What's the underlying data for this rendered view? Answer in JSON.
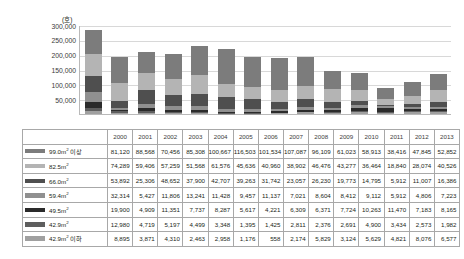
{
  "chart_data": {
    "type": "bar",
    "stacked": true,
    "title": "",
    "subtitle": "",
    "unit_label": "(호)",
    "xlabel": "",
    "ylabel": "",
    "ylim": [
      0,
      300000
    ],
    "ytick_values": [
      300000,
      250000,
      200000,
      150000,
      100000,
      50000
    ],
    "ytick_labels": [
      "300,000",
      "250,000",
      "200,000",
      "150,000",
      "100,000",
      "50,000"
    ],
    "grid": true,
    "legend_position": "table-row-headers",
    "categories": [
      "2000",
      "2001",
      "2002",
      "2003",
      "2004",
      "2005",
      "2006",
      "2007",
      "2008",
      "2009",
      "2010",
      "2011",
      "2012",
      "2013"
    ],
    "series": [
      {
        "name": "99.0m² 이상",
        "name_base": "99.0m",
        "name_sup": "2",
        "name_tail": " 이상",
        "color": "#7c7c7c",
        "values": [
          81120,
          88568,
          70456,
          85308,
          100667,
          116503,
          101534,
          107087,
          96109,
          61023,
          58913,
          38416,
          47845,
          52852
        ],
        "labels": [
          "81,120",
          "88,568",
          "70,456",
          "85,308",
          "100,667",
          "116,503",
          "101,534",
          "107,087",
          "96,109",
          "61,023",
          "58,913",
          "38,416",
          "47,845",
          "52,852"
        ]
      },
      {
        "name": "82.5m²",
        "name_base": "82.5m",
        "name_sup": "2",
        "name_tail": "",
        "color": "#b4b4b4",
        "values": [
          74289,
          59406,
          57259,
          51568,
          61576,
          45636,
          40960,
          38902,
          46476,
          43277,
          36464,
          18840,
          28074,
          40526
        ],
        "labels": [
          "74,289",
          "59,406",
          "57,259",
          "51,568",
          "61,576",
          "45,636",
          "40,960",
          "38,902",
          "46,476",
          "43,277",
          "36,464",
          "18,840",
          "28,074",
          "40,526"
        ]
      },
      {
        "name": "66.0m²",
        "name_base": "66.0m",
        "name_sup": "2",
        "name_tail": "",
        "color": "#4f4f4f",
        "values": [
          53892,
          25306,
          48652,
          37900,
          42707,
          39263,
          31742,
          23057,
          26230,
          19773,
          14795,
          5912,
          11007,
          16386
        ],
        "labels": [
          "53,892",
          "25,306",
          "48,652",
          "37,900",
          "42,707",
          "39,263",
          "31,742",
          "23,057",
          "26,230",
          "19,773",
          "14,795",
          "5,912",
          "11,007",
          "16,386"
        ]
      },
      {
        "name": "59.4m²",
        "name_base": "59.4m",
        "name_sup": "2",
        "name_tail": "",
        "color": "#909090",
        "values": [
          32314,
          5427,
          11806,
          13241,
          11428,
          9457,
          11137,
          7021,
          8604,
          8412,
          9112,
          5912,
          4806,
          7223
        ],
        "labels": [
          "32,314",
          "5,427",
          "11,806",
          "13,241",
          "11,428",
          "9,457",
          "11,137",
          "7,021",
          "8,604",
          "8,412",
          "9,112",
          "5,912",
          "4,806",
          "7,223"
        ]
      },
      {
        "name": "49.5m²",
        "name_base": "49.5m",
        "name_sup": "2",
        "name_tail": "",
        "color": "#2b2b2b",
        "values": [
          19900,
          4909,
          11351,
          7737,
          8287,
          5617,
          4221,
          6309,
          6371,
          7724,
          10263,
          11470,
          7183,
          8165
        ],
        "labels": [
          "19,900",
          "4,909",
          "11,351",
          "7,737",
          "8,287",
          "5,617",
          "4,221",
          "6,309",
          "6,371",
          "7,724",
          "10,263",
          "11,470",
          "7,183",
          "8,165"
        ]
      },
      {
        "name": "42.9m²",
        "name_base": "42.9m",
        "name_sup": "2",
        "name_tail": "",
        "color": "#5e5e5e",
        "values": [
          12980,
          4719,
          5197,
          4499,
          3348,
          1395,
          1425,
          2811,
          2376,
          2691,
          4900,
          3434,
          2573,
          1982
        ],
        "labels": [
          "12,980",
          "4,719",
          "5,197",
          "4,499",
          "3,348",
          "1,395",
          "1,425",
          "2,811",
          "2,376",
          "2,691",
          "4,900",
          "3,434",
          "2,573",
          "1,982"
        ]
      },
      {
        "name": "42.9m² 이하",
        "name_base": "42.9m",
        "name_sup": "2",
        "name_tail": " 이하",
        "color": "#a0a0a0",
        "values": [
          8895,
          3871,
          4310,
          2463,
          2958,
          1176,
          558,
          2174,
          5829,
          3124,
          5629,
          4821,
          8076,
          6577
        ],
        "labels": [
          "8,895",
          "3,871",
          "4,310",
          "2,463",
          "2,958",
          "1,176",
          "558",
          "2,174",
          "5,829",
          "3,124",
          "5,629",
          "4,821",
          "8,076",
          "6,577"
        ]
      }
    ]
  },
  "table": {
    "corner_header": "",
    "year_headers": [
      "2000",
      "2001",
      "2002",
      "2003",
      "2004",
      "2005",
      "2006",
      "2007",
      "2008",
      "2009",
      "2010",
      "2011",
      "2012",
      "2013"
    ]
  }
}
